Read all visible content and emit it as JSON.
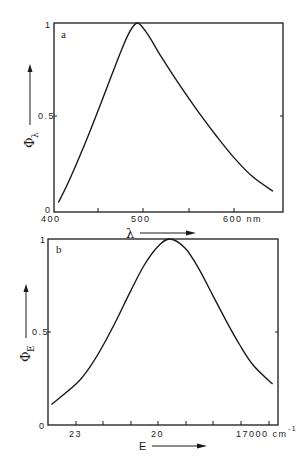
{
  "figure": {
    "panel_a": {
      "label": "a",
      "ylabel_symbol": "Φ",
      "ylabel_subscript": "λ",
      "xlabel_symbol": "λ",
      "y_ticks": [
        "0",
        "0.5",
        "1"
      ],
      "x_ticks": [
        "400",
        "500",
        "600 nm"
      ]
    },
    "panel_b": {
      "label": "b",
      "ylabel_symbol": "Φ",
      "ylabel_subscript": "E",
      "xlabel_symbol": "E",
      "y_ticks": [
        "0",
        "0.5",
        "1"
      ],
      "x_ticks": [
        "23",
        "20",
        "17000 cm"
      ],
      "x_unit_superscript": "-1"
    }
  },
  "chart_data": [
    {
      "type": "line",
      "title": "a",
      "xlabel": "λ (nm)",
      "ylabel": "Φλ",
      "xlim": [
        400,
        650
      ],
      "ylim": [
        0,
        1
      ],
      "x_ticks": [
        400,
        450,
        500,
        550,
        600
      ],
      "x_tick_labels": [
        "400",
        "",
        "500",
        "",
        "600 nm"
      ],
      "y_ticks": [
        0,
        0.5,
        1
      ],
      "grid": false,
      "series": [
        {
          "name": "Φλ",
          "x": [
            407,
            420,
            440,
            460,
            475,
            485,
            494,
            505,
            520,
            540,
            560,
            580,
            600,
            620,
            643
          ],
          "y": [
            0.04,
            0.17,
            0.4,
            0.65,
            0.84,
            0.95,
            1.0,
            0.94,
            0.82,
            0.67,
            0.53,
            0.4,
            0.28,
            0.18,
            0.1
          ]
        }
      ]
    },
    {
      "type": "line",
      "title": "b",
      "xlabel": "E (cm⁻¹)",
      "ylabel": "ΦE",
      "xlim": [
        24000,
        15700
      ],
      "ylim": [
        0,
        1
      ],
      "x_ticks": [
        23000,
        22000,
        21000,
        20000,
        19000,
        18000,
        17000,
        16000
      ],
      "x_tick_labels": [
        "23",
        "",
        "",
        "20",
        "",
        "",
        "17000 cm⁻¹",
        ""
      ],
      "y_ticks": [
        0,
        0.5,
        1
      ],
      "grid": false,
      "series": [
        {
          "name": "ΦE",
          "x": [
            23900,
            23000,
            22500,
            22000,
            21500,
            21000,
            20500,
            20000,
            19560,
            19000,
            18500,
            18000,
            17500,
            17000,
            16500,
            15800
          ],
          "y": [
            0.11,
            0.22,
            0.31,
            0.43,
            0.57,
            0.72,
            0.86,
            0.96,
            1.0,
            0.95,
            0.84,
            0.7,
            0.56,
            0.43,
            0.32,
            0.22
          ]
        }
      ]
    }
  ]
}
